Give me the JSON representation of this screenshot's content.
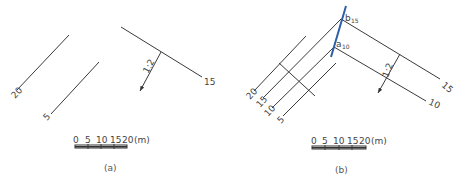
{
  "panels": [
    {
      "caption": "(a)",
      "contours": [
        {
          "label": "20"
        },
        {
          "label": "5"
        },
        {
          "label": "15"
        }
      ],
      "slope_label": "1:2",
      "scale_bar": {
        "ticks": [
          "0",
          "5",
          "10",
          "15",
          "20"
        ],
        "unit": "(m)"
      }
    },
    {
      "caption": "(b)",
      "contours_left": [
        {
          "label": "20"
        },
        {
          "label": "15"
        },
        {
          "label": "10"
        },
        {
          "label": "5"
        }
      ],
      "contours_right": [
        {
          "label": "15"
        },
        {
          "label": "10"
        }
      ],
      "points": [
        {
          "letter": "b",
          "sub": "15"
        },
        {
          "letter": "a",
          "sub": "10"
        }
      ],
      "slope_label": "1:2",
      "scale_bar": {
        "ticks": [
          "0",
          "5",
          "10",
          "15",
          "20"
        ],
        "unit": "(m)"
      },
      "intersection_line_color": "#2f5fa8"
    }
  ]
}
